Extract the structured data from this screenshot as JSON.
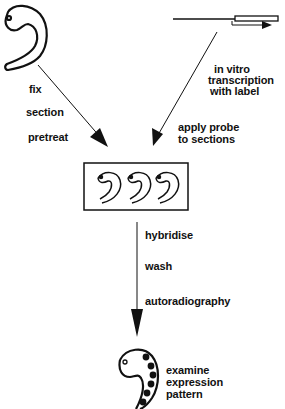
{
  "diagram": {
    "left_branch": {
      "steps": [
        "fix",
        "section",
        "pretreat"
      ]
    },
    "right_branch": {
      "probe_steps": [
        "in vitro",
        "transcription",
        "with label"
      ],
      "apply_steps": [
        "apply probe",
        "to sections"
      ]
    },
    "center": {
      "steps": [
        "hybridise",
        "wash",
        "autoradiography"
      ]
    },
    "result": {
      "lines": [
        "examine",
        "expression",
        "pattern"
      ]
    },
    "colors": {
      "ink": "#111111",
      "background": "#ffffff"
    }
  }
}
